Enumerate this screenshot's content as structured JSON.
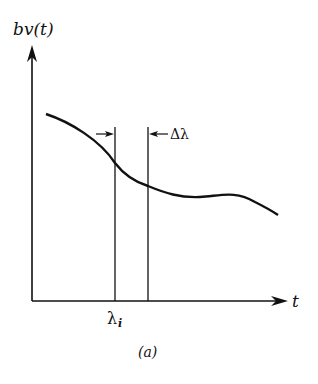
{
  "figure": {
    "y_axis_label": "bv(t)",
    "x_axis_label": "t",
    "lambda_label": "λ",
    "lambda_subscript": "i",
    "delta_label": "Δλ",
    "caption": "(a)"
  },
  "colors": {
    "ink": "#111111",
    "background": "#ffffff"
  }
}
